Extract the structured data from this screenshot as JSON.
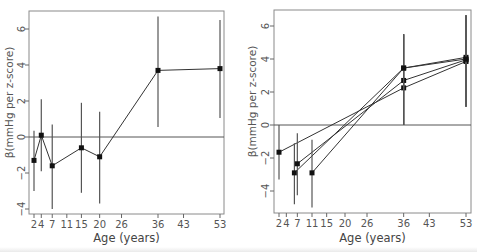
{
  "chart_data": [
    {
      "type": "line",
      "panel": "left",
      "title": "",
      "xlabel": "Age (years)",
      "ylabel": "β(mmHg per z-score)",
      "xticks": [
        2,
        4,
        7,
        11,
        15,
        20,
        26,
        36,
        43,
        53
      ],
      "yticks": [
        -4,
        -2,
        0,
        2,
        4,
        6
      ],
      "ylim": [
        -4.2,
        7.0
      ],
      "reference_line_y": 0,
      "grid": false,
      "legend": null,
      "series": [
        {
          "name": "series-1",
          "x": [
            2,
            4,
            7,
            15,
            20,
            36,
            53
          ],
          "y": [
            -1.3,
            0.1,
            -1.6,
            -0.6,
            -1.1,
            3.7,
            3.8
          ],
          "ci_low": [
            -3.0,
            -1.9,
            -4.0,
            -3.1,
            -3.7,
            0.55,
            1.05
          ],
          "ci_high": [
            0.35,
            2.1,
            0.7,
            1.9,
            1.4,
            6.7,
            6.5
          ]
        }
      ]
    },
    {
      "type": "line",
      "panel": "right",
      "title": "",
      "xlabel": "Age (years)",
      "ylabel": "β(mmHg per z-score)",
      "xticks": [
        2,
        4,
        7,
        11,
        15,
        20,
        26,
        36,
        43,
        53
      ],
      "yticks": [
        -4,
        -2,
        0,
        2,
        4,
        6
      ],
      "ylim": [
        -5.2,
        6.9
      ],
      "reference_line_y": 0,
      "grid": false,
      "legend": null,
      "series": [
        {
          "name": "series-a",
          "x": [
            2,
            36,
            53
          ],
          "y": [
            -1.65,
            2.25,
            3.85
          ],
          "ci_low": [
            -3.3,
            0.0,
            1.1
          ],
          "ci_high": [
            0.0,
            5.5,
            6.65
          ]
        },
        {
          "name": "series-b",
          "x": [
            6.2,
            36,
            53
          ],
          "y": [
            -2.9,
            3.45,
            4.1
          ],
          "ci_low": [
            -4.8,
            0.0,
            1.1
          ],
          "ci_high": [
            -1.1,
            5.5,
            6.65
          ]
        },
        {
          "name": "series-c",
          "x": [
            7,
            36,
            53
          ],
          "y": [
            -2.35,
            2.7,
            3.95
          ],
          "ci_low": [
            -4.25,
            0.0,
            1.1
          ],
          "ci_high": [
            -0.5,
            5.5,
            6.65
          ]
        },
        {
          "name": "series-d",
          "x": [
            11,
            36,
            53
          ],
          "y": [
            -2.9,
            3.45,
            4.0
          ],
          "ci_low": [
            -5.0,
            0.0,
            1.1
          ],
          "ci_high": [
            -0.9,
            5.5,
            6.65
          ]
        }
      ]
    }
  ],
  "layout": {
    "panels": [
      {
        "frame": [
          29,
          11,
          224,
          214
        ],
        "x_px": {
          "2": 34,
          "53": 220
        },
        "y_px": {
          "0": 137,
          "per_unit": 18
        },
        "ylabel_x": 13,
        "ticklab_x": 22
      },
      {
        "frame": [
          274,
          10,
          471,
          213
        ],
        "x_px": {
          "2": 279,
          "53": 466
        },
        "y_px": {
          "0": 125,
          "per_unit": 16.5
        },
        "ylabel_x": 256,
        "ticklab_x": 266
      }
    ]
  }
}
